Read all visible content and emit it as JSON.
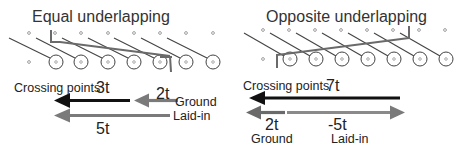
{
  "panels": [
    {
      "title": "Equal underlapping",
      "crossing_label": "Crossing points",
      "crossing_value": "3t",
      "ground_value": "2t",
      "ground_label": "Ground",
      "laidin_value": "5t",
      "laidin_label": "Laid-in"
    },
    {
      "title": "Opposite underlapping",
      "crossing_label": "Crossing points",
      "crossing_value": "7t",
      "ground_value": "2t",
      "ground_label": "Ground",
      "laidin_value": "-5t",
      "laidin_label": "Laid-in"
    }
  ],
  "colors": {
    "black_arrow": "#111111",
    "gray_arrow": "#7a7a7a",
    "thread": "#555555",
    "laidin_thread": "#6a6a6a"
  }
}
